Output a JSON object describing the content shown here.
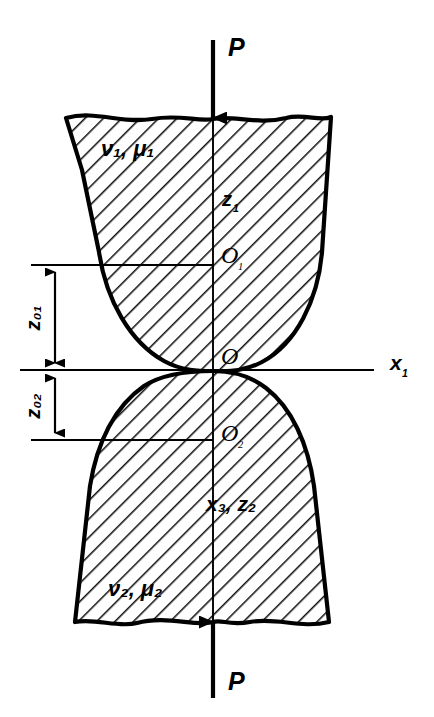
{
  "figure": {
    "type": "technical-diagram",
    "background_color": "#ffffff",
    "line_color": "#000000"
  },
  "loads": {
    "top_force_label": "P",
    "bottom_force_label": "P"
  },
  "bodies": {
    "upper": {
      "material_label": "ν",
      "material_sub1": "1",
      "material_sep": ", ",
      "material_label2": "μ",
      "material_sub2": "1",
      "material_full": "ν₁, μ₁"
    },
    "lower": {
      "material_label": "ν",
      "material_sub1": "2",
      "material_sep": ", ",
      "material_label2": "μ",
      "material_sub2": "2",
      "material_full": "ν₂, μ₂"
    }
  },
  "points": {
    "center_upper": {
      "label": "O",
      "sub": "1"
    },
    "contact": {
      "label": "O",
      "sub": ""
    },
    "center_lower": {
      "label": "O",
      "sub": "2"
    }
  },
  "axes": {
    "vertical_upper": {
      "label": "z",
      "sub": "1"
    },
    "horizontal": {
      "label": "x",
      "sub": "1"
    },
    "lower_axes": {
      "label1": "x",
      "sub1": "3",
      "sep": ", ",
      "label2": "z",
      "sub2": "2",
      "full": "x₃, z₂"
    }
  },
  "dimensions": [
    {
      "label": "z",
      "sub": "01",
      "full": "z₀₁",
      "from_y": 265,
      "to_y": 370
    },
    {
      "label": "z",
      "sub": "02",
      "full": "z₀₂",
      "from_y": 370,
      "to_y": 440
    }
  ],
  "hatching": {
    "angle_deg": 45,
    "description": "diagonal section hatching"
  }
}
